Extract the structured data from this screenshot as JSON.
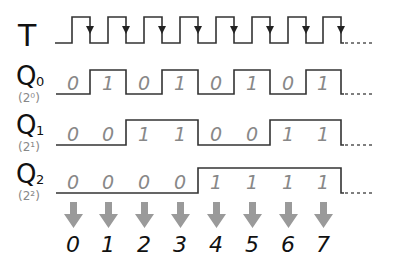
{
  "diagram": {
    "type": "timing-diagram",
    "signals": [
      {
        "name": "T",
        "subscript": "",
        "weight_label": ""
      },
      {
        "name": "Q",
        "subscript": "0",
        "weight_label": "(2⁰)"
      },
      {
        "name": "Q",
        "subscript": "1",
        "weight_label": "(2¹)"
      },
      {
        "name": "Q",
        "subscript": "2",
        "weight_label": "(2²)"
      }
    ],
    "q0_bits": [
      "0",
      "1",
      "0",
      "1",
      "0",
      "1",
      "0",
      "1"
    ],
    "q1_bits": [
      "0",
      "0",
      "1",
      "1",
      "0",
      "0",
      "1",
      "1"
    ],
    "q2_bits": [
      "0",
      "0",
      "0",
      "0",
      "1",
      "1",
      "1",
      "1"
    ],
    "counts": [
      "0",
      "1",
      "2",
      "3",
      "4",
      "5",
      "6",
      "7"
    ],
    "colors": {
      "line": "#333333",
      "bit_text": "#888888",
      "arrow": "#999999",
      "count_text": "#111111"
    }
  }
}
